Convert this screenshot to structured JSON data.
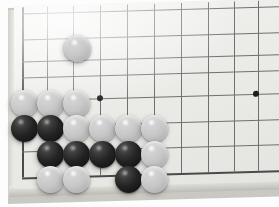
{
  "scene": {
    "title": "Go board position",
    "board_type": "goban",
    "perspective": "3d-angled",
    "background_color": "#fdfdfd"
  },
  "board": {
    "surface_color": "#ececea",
    "line_color": "#6f6f6f",
    "edge_line_color": "#4a4a4a",
    "bevel_color": "#d2d2cd",
    "visible_columns": 10,
    "visible_rows": 8,
    "vertical_lines_x": [
      22,
      47,
      73,
      100,
      127,
      154,
      181,
      208,
      234,
      258
    ],
    "horizontal_lines_y": [
      14,
      40,
      62,
      78,
      101,
      127,
      152,
      178
    ],
    "left_edge_is_board_border": true,
    "bottom_edge_is_board_border": true
  },
  "star_points": [
    {
      "name": "hoshi-left",
      "x": 100,
      "y": 101
    },
    {
      "name": "hoshi-right",
      "x": 256,
      "y": 101
    }
  ],
  "stones": [
    {
      "color": "white",
      "x": 77,
      "y": 48,
      "label": "white-stone-top"
    },
    {
      "color": "white",
      "x": 24,
      "y": 103,
      "label": "white-stone"
    },
    {
      "color": "white",
      "x": 50,
      "y": 103,
      "label": "white-stone"
    },
    {
      "color": "white",
      "x": 76,
      "y": 103,
      "label": "white-stone"
    },
    {
      "color": "black",
      "x": 24,
      "y": 128,
      "label": "black-stone"
    },
    {
      "color": "black",
      "x": 50,
      "y": 128,
      "label": "black-stone"
    },
    {
      "color": "white",
      "x": 76,
      "y": 128,
      "label": "white-stone"
    },
    {
      "color": "white",
      "x": 102,
      "y": 128,
      "label": "white-stone"
    },
    {
      "color": "white",
      "x": 128,
      "y": 128,
      "label": "white-stone"
    },
    {
      "color": "white",
      "x": 154,
      "y": 128,
      "label": "white-stone"
    },
    {
      "color": "black",
      "x": 50,
      "y": 154,
      "label": "black-stone"
    },
    {
      "color": "black",
      "x": 76,
      "y": 154,
      "label": "black-stone"
    },
    {
      "color": "black",
      "x": 102,
      "y": 154,
      "label": "black-stone"
    },
    {
      "color": "black",
      "x": 128,
      "y": 154,
      "label": "black-stone"
    },
    {
      "color": "white",
      "x": 154,
      "y": 154,
      "label": "white-stone"
    },
    {
      "color": "white",
      "x": 50,
      "y": 179,
      "label": "white-stone"
    },
    {
      "color": "white",
      "x": 76,
      "y": 179,
      "label": "white-stone"
    },
    {
      "color": "black",
      "x": 128,
      "y": 179,
      "label": "black-stone"
    },
    {
      "color": "white",
      "x": 154,
      "y": 179,
      "label": "white-stone"
    }
  ],
  "colors": {
    "white_stone": "#f2f2f2",
    "black_stone": "#141414",
    "board": "#ececea"
  }
}
